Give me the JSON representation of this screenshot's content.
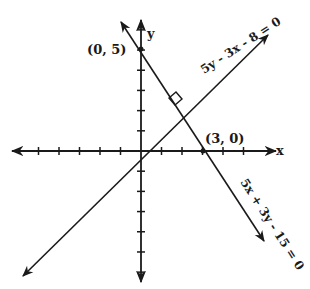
{
  "diagram": {
    "type": "coordinate-plane",
    "axes": {
      "x_label": "x",
      "y_label": "y",
      "origin_px": [
        141,
        151
      ],
      "unit_px": 20.5,
      "x_ticks": [
        -5,
        -4,
        -3,
        -2,
        -1,
        1,
        2,
        3,
        4,
        5
      ],
      "y_ticks": [
        -6,
        -5,
        -4,
        -3,
        -2,
        -1,
        1,
        2,
        3,
        4,
        5,
        6
      ]
    },
    "points": [
      {
        "label": "(0, 5)",
        "x": 0,
        "y": 5
      },
      {
        "label": "(3, 0)",
        "x": 3,
        "y": 0
      }
    ],
    "lines": [
      {
        "equation": "5y - 3x - 8 = 0",
        "slope": 0.6,
        "intercept": 1.6
      },
      {
        "equation": "5x + 3y - 15 = 0",
        "slope": -1.6667,
        "intercept": 5
      }
    ],
    "annotations": {
      "right_angle_marker": true
    },
    "color": "#1a1a1a"
  }
}
